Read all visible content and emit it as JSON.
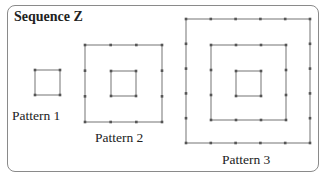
{
  "title": "Sequence Z",
  "colors": {
    "line": "#a8a8a8",
    "dot": "#555555",
    "border": "#8a8a8a"
  },
  "patterns": [
    {
      "label": "Pattern 1",
      "label_pos": [
        12,
        108
      ],
      "squares": [
        {
          "x": 35,
          "y": 70,
          "size": 25,
          "segments": 1
        }
      ]
    },
    {
      "label": "Pattern 2",
      "label_pos": [
        95,
        130
      ],
      "squares": [
        {
          "x": 85,
          "y": 45,
          "size": 77,
          "segments": 3
        },
        {
          "x": 111,
          "y": 71,
          "size": 25,
          "segments": 1
        }
      ]
    },
    {
      "label": "Pattern 3",
      "label_pos": [
        222,
        152
      ],
      "squares": [
        {
          "x": 186,
          "y": 19,
          "size": 124,
          "segments": 5
        },
        {
          "x": 211,
          "y": 45,
          "size": 75,
          "segments": 3
        },
        {
          "x": 236,
          "y": 71,
          "size": 25,
          "segments": 1
        }
      ]
    }
  ]
}
